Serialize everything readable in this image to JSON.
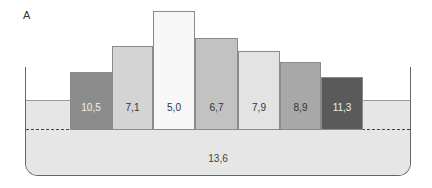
{
  "panel_label": "A",
  "base": {
    "label": "13,6",
    "color": "#e6e6e6"
  },
  "chart_data": {
    "type": "bar",
    "title": "",
    "categories": [
      "1",
      "2",
      "3",
      "4",
      "5",
      "6",
      "7"
    ],
    "values": [
      10.5,
      7.1,
      5.0,
      6.7,
      7.9,
      8.9,
      11.3
    ],
    "value_labels": [
      "10,5",
      "7,1",
      "5,0",
      "6,7",
      "7,9",
      "8,9",
      "11,3"
    ],
    "base_value": 13.6,
    "base_label": "13,6",
    "xlabel": "",
    "ylabel": "",
    "grid": false,
    "legend": "none"
  },
  "bars": [
    {
      "label": "10,5",
      "x": 70,
      "w": 42,
      "top": 72,
      "color": "#8c8c8c",
      "text": "#f2f2f2"
    },
    {
      "label": "7,1",
      "x": 112,
      "w": 41,
      "top": 46,
      "color": "#d4d4d4",
      "text": "#333333"
    },
    {
      "label": "5,0",
      "x": 153,
      "w": 42,
      "top": 11,
      "color": "#f7f7f7",
      "text": "#333333"
    },
    {
      "label": "6,7",
      "x": 195,
      "w": 43,
      "top": 38,
      "color": "#c2c2c2",
      "text": "#333333"
    },
    {
      "label": "7,9",
      "x": 238,
      "w": 42,
      "top": 51,
      "color": "#e3e3e3",
      "text": "#333333"
    },
    {
      "label": "8,9",
      "x": 280,
      "w": 41,
      "top": 62,
      "color": "#a8a8a8",
      "text": "#333333"
    },
    {
      "label": "11,3",
      "x": 321,
      "w": 42,
      "top": 77,
      "color": "#5a5a5a",
      "text": "#eeeeee"
    }
  ]
}
